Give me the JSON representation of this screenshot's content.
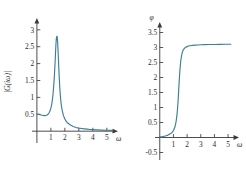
{
  "figure": {
    "background_color": "#ffffff",
    "axis_color": "#3a3a3a",
    "curve_color": "#3d7f93"
  },
  "chart_data": [
    {
      "type": "line",
      "name": "magnitude-response",
      "title": "",
      "xlabel": "ω",
      "ylabel": "|G(iω)|",
      "xlim": [
        -0.35,
        5.8
      ],
      "ylim": [
        -0.35,
        3.35
      ],
      "grid": false,
      "legend": "none",
      "xticks": [
        1,
        2,
        3,
        4,
        5
      ],
      "xtick_labels": [
        "1",
        "2",
        "3",
        "4",
        "5"
      ],
      "yticks": [
        0.5,
        1,
        1.5,
        2,
        2.5,
        3
      ],
      "ytick_labels": [
        "0.5",
        "1",
        "1.5",
        "2",
        "2.5",
        "3"
      ],
      "x": [
        0.0,
        0.1,
        0.2,
        0.3,
        0.4,
        0.5,
        0.6,
        0.7,
        0.8,
        0.9,
        1.0,
        1.05,
        1.1,
        1.15,
        1.2,
        1.25,
        1.3,
        1.33,
        1.36,
        1.39,
        1.42,
        1.45,
        1.48,
        1.51,
        1.54,
        1.57,
        1.6,
        1.65,
        1.7,
        1.75,
        1.8,
        1.9,
        2.0,
        2.1,
        2.2,
        2.4,
        2.6,
        2.8,
        3.0,
        3.2,
        3.4,
        3.6,
        3.8,
        4.0,
        4.3,
        4.6,
        5.0,
        5.4
      ],
      "y": [
        0.5,
        0.5,
        0.49,
        0.48,
        0.47,
        0.46,
        0.46,
        0.47,
        0.5,
        0.56,
        0.68,
        0.77,
        0.9,
        1.08,
        1.32,
        1.63,
        2.02,
        2.3,
        2.56,
        2.74,
        2.81,
        2.8,
        2.66,
        2.42,
        2.13,
        1.84,
        1.57,
        1.2,
        0.94,
        0.76,
        0.63,
        0.46,
        0.36,
        0.29,
        0.24,
        0.18,
        0.14,
        0.11,
        0.09,
        0.08,
        0.07,
        0.06,
        0.05,
        0.045,
        0.038,
        0.032,
        0.026,
        0.022
      ]
    },
    {
      "type": "line",
      "name": "phase-response",
      "title": "",
      "xlabel": "ω",
      "ylabel": "φ",
      "xlim": [
        -0.35,
        5.8
      ],
      "ylim": [
        -0.75,
        3.85
      ],
      "grid": false,
      "legend": "none",
      "xticks": [
        1,
        2,
        3,
        4,
        5
      ],
      "xtick_labels": [
        "1",
        "2",
        "3",
        "4",
        "5"
      ],
      "yticks": [
        -0.5,
        0.5,
        1,
        1.5,
        2,
        2.5,
        3,
        3.5
      ],
      "ytick_labels": [
        "-0.5",
        "0.5",
        "1",
        "1.5",
        "2",
        "2.5",
        "3",
        "3.5"
      ],
      "x": [
        0.0,
        0.2,
        0.4,
        0.6,
        0.8,
        0.9,
        1.0,
        1.05,
        1.1,
        1.15,
        1.2,
        1.25,
        1.3,
        1.33,
        1.36,
        1.39,
        1.42,
        1.45,
        1.48,
        1.51,
        1.55,
        1.6,
        1.65,
        1.7,
        1.75,
        1.8,
        1.9,
        2.0,
        2.1,
        2.2,
        2.4,
        2.6,
        2.8,
        3.0,
        3.3,
        3.6,
        4.0,
        4.4,
        4.8,
        5.0,
        5.2
      ],
      "y": [
        0.02,
        0.03,
        0.05,
        0.08,
        0.13,
        0.17,
        0.23,
        0.28,
        0.34,
        0.43,
        0.55,
        0.72,
        0.96,
        1.15,
        1.37,
        1.62,
        1.86,
        2.08,
        2.27,
        2.43,
        2.6,
        2.74,
        2.84,
        2.9,
        2.94,
        2.97,
        3.01,
        3.03,
        3.05,
        3.06,
        3.07,
        3.08,
        3.085,
        3.09,
        3.095,
        3.1,
        3.1,
        3.105,
        3.11,
        3.11,
        3.11
      ]
    }
  ]
}
